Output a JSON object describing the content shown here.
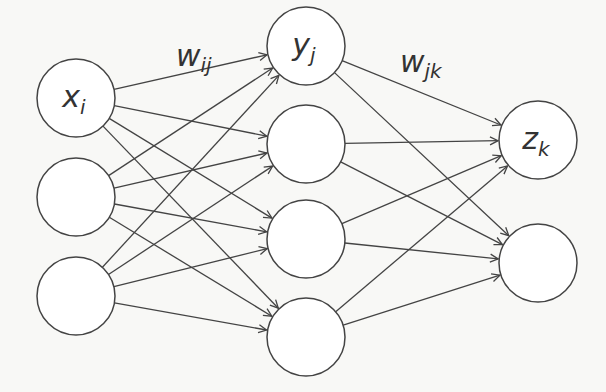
{
  "diagram": {
    "type": "feedforward-neural-network",
    "colors": {
      "stroke": "#444444",
      "background": "#f8f8f6",
      "node_fill": "#ffffff",
      "text": "#333333"
    },
    "layers": [
      {
        "name": "input",
        "nodes": [
          {
            "id": "x1",
            "label": "x",
            "sub": "i",
            "cx": 76,
            "cy": 98
          },
          {
            "id": "x2",
            "label": "",
            "sub": "",
            "cx": 76,
            "cy": 197
          },
          {
            "id": "x3",
            "label": "",
            "sub": "",
            "cx": 76,
            "cy": 296
          }
        ]
      },
      {
        "name": "hidden",
        "nodes": [
          {
            "id": "y1",
            "label": "y",
            "sub": "j",
            "cx": 306,
            "cy": 46
          },
          {
            "id": "y2",
            "label": "",
            "sub": "",
            "cx": 306,
            "cy": 144
          },
          {
            "id": "y3",
            "label": "",
            "sub": "",
            "cx": 306,
            "cy": 239
          },
          {
            "id": "y4",
            "label": "",
            "sub": "",
            "cx": 306,
            "cy": 337
          }
        ]
      },
      {
        "name": "output",
        "nodes": [
          {
            "id": "z1",
            "label": "z",
            "sub": "k",
            "cx": 538,
            "cy": 140
          },
          {
            "id": "z2",
            "label": "",
            "sub": "",
            "cx": 538,
            "cy": 263
          }
        ]
      }
    ],
    "node_radius": 39,
    "weight_labels": [
      {
        "id": "w_ij",
        "label": "w",
        "sub": "ij",
        "x": 176,
        "y": 66
      },
      {
        "id": "w_jk",
        "label": "w",
        "sub": "jk",
        "x": 400,
        "y": 72
      }
    ]
  }
}
